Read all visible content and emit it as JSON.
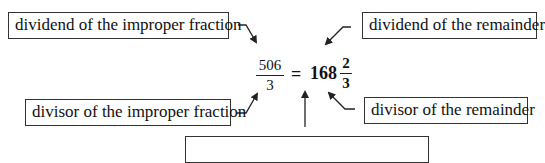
{
  "labels": {
    "dividend_improper": "dividend of the improper fraction",
    "dividend_remainder": "dividend of the remainder",
    "divisor_improper": "divisor of the improper fraction",
    "divisor_remainder": "divisor of the remainder",
    "quotient": ""
  },
  "equation": {
    "improper_numerator": "506",
    "improper_denominator": "3",
    "equals": "=",
    "whole_part": "168",
    "remainder_numerator": "2",
    "remainder_denominator": "3"
  },
  "colors": {
    "line": "#222222",
    "background": "#ffffff"
  }
}
